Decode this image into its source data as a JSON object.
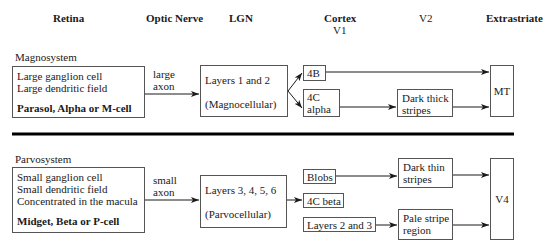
{
  "columns": {
    "retina": "Retina",
    "optic_nerve": "Optic Nerve",
    "lgn": "LGN",
    "cortex": "Cortex",
    "v1": "V1",
    "v2": "V2",
    "extrastriate": "Extrastriate"
  },
  "magno": {
    "title": "Magnosystem",
    "retina": {
      "line1": "Large ganglion cell",
      "line2": "Large dendritic field",
      "cell": "Parasol, Alpha or M-cell"
    },
    "axon": {
      "line1": "large",
      "line2": "axon"
    },
    "lgn": {
      "line1": "Layers 1 and 2",
      "line2": "(Magnocellular)"
    },
    "v1": {
      "a": "4B",
      "b_line1": "4C",
      "b_line2": "alpha"
    },
    "v2": {
      "line1": "Dark thick",
      "line2": "stripes"
    },
    "extra": "MT"
  },
  "parvo": {
    "title": "Parvosystem",
    "retina": {
      "line1": "Small ganglion cell",
      "line2": "Small dendritic field",
      "line3": "Concentrated in the macula",
      "cell": "Midget, Beta or P-cell"
    },
    "axon": {
      "line1": "small",
      "line2": "axon"
    },
    "lgn": {
      "line1": "Layers 3, 4, 5, 6",
      "line2": "(Parvocellular)"
    },
    "v1": {
      "a": "Blobs",
      "b": "4C beta",
      "c": "Layers 2 and 3"
    },
    "v2": {
      "a_line1": "Dark thin",
      "a_line2": "stripes",
      "b_line1": "Pale stripe",
      "b_line2": "region"
    },
    "extra": "V4"
  },
  "colors": {
    "line": "#1a1a1a",
    "box_border": "#555555",
    "divider": "#000000"
  }
}
